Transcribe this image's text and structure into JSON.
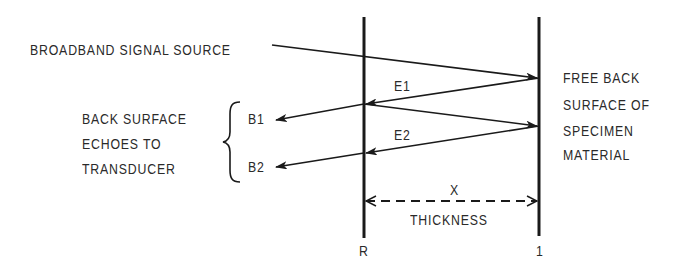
{
  "diagram": {
    "source_label": "BROADBAND SIGNAL SOURCE",
    "echo_labels": [
      "E1",
      "E2"
    ],
    "back_echo_labels": [
      "B1",
      "B2"
    ],
    "left_group_label": [
      "BACK SURFACE",
      "ECHOES TO",
      "TRANSDUCER"
    ],
    "right_surface_label": [
      "FREE BACK",
      "SURFACE OF",
      "SPECIMEN",
      "MATERIAL"
    ],
    "dimension_label": "X",
    "dimension_caption": "THICKNESS",
    "left_boundary_label": "R",
    "right_boundary_label": "1",
    "colors": {
      "line": "#1a1a1a",
      "text": "#2a2a2a",
      "background": "#ffffff"
    }
  }
}
